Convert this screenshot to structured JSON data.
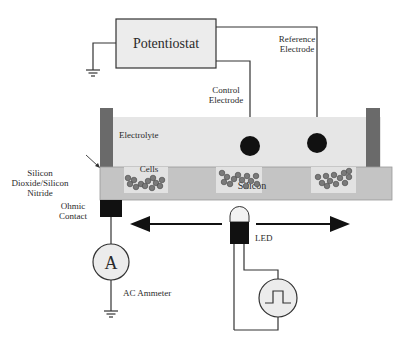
{
  "diagram": {
    "potentiostat": {
      "label": "Potentiostat"
    },
    "reference_electrode": {
      "label_line1": "Reference",
      "label_line2": "Electrode"
    },
    "control_electrode": {
      "label_line1": "Control",
      "label_line2": "Electrode"
    },
    "electrolyte": {
      "label": "Electrolyte"
    },
    "insulator": {
      "label_line1": "Silicon",
      "label_line2": "Dioxide/Silicon",
      "label_line3": "Nitride"
    },
    "cells": {
      "label": "Cells"
    },
    "silicon": {
      "label": "Silicon"
    },
    "ohmic_contact": {
      "label_line1": "Ohmic",
      "label_line2": "Contact"
    },
    "ammeter": {
      "symbol": "A",
      "label": "AC Ammeter"
    },
    "led": {
      "label": "LED"
    },
    "colors": {
      "box_fill": "#ececec",
      "electrolyte": "#e6e6e6",
      "silicon": "#c4c4c4",
      "well": "#e2e2e2",
      "wall": "#6a6a6a",
      "cell": "#7a7a7a",
      "dark": "#111111",
      "line": "#333333"
    }
  }
}
